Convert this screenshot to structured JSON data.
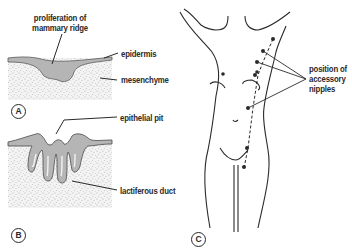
{
  "panels": {
    "A": {
      "letter": "A",
      "labels": {
        "proliferation": "proliferation of",
        "proliferation_line2": "mammary ridge",
        "epidermis": "epidermis",
        "mesenchyme": "mesenchyme"
      }
    },
    "B": {
      "letter": "B",
      "labels": {
        "epithelial_pit": "epithelial pit",
        "lactiferous_duct": "lactiferous duct"
      }
    },
    "C": {
      "letter": "C",
      "labels": {
        "accessory_line1": "position of",
        "accessory_line2": "accessory",
        "accessory_line3": "nipples"
      }
    }
  },
  "colors": {
    "ink": "#2a2a2a",
    "epidermis_fill": "#b8b8b8",
    "mesenchyme_fill": "#f2f2f2",
    "stipple": "#8a8a8a"
  }
}
